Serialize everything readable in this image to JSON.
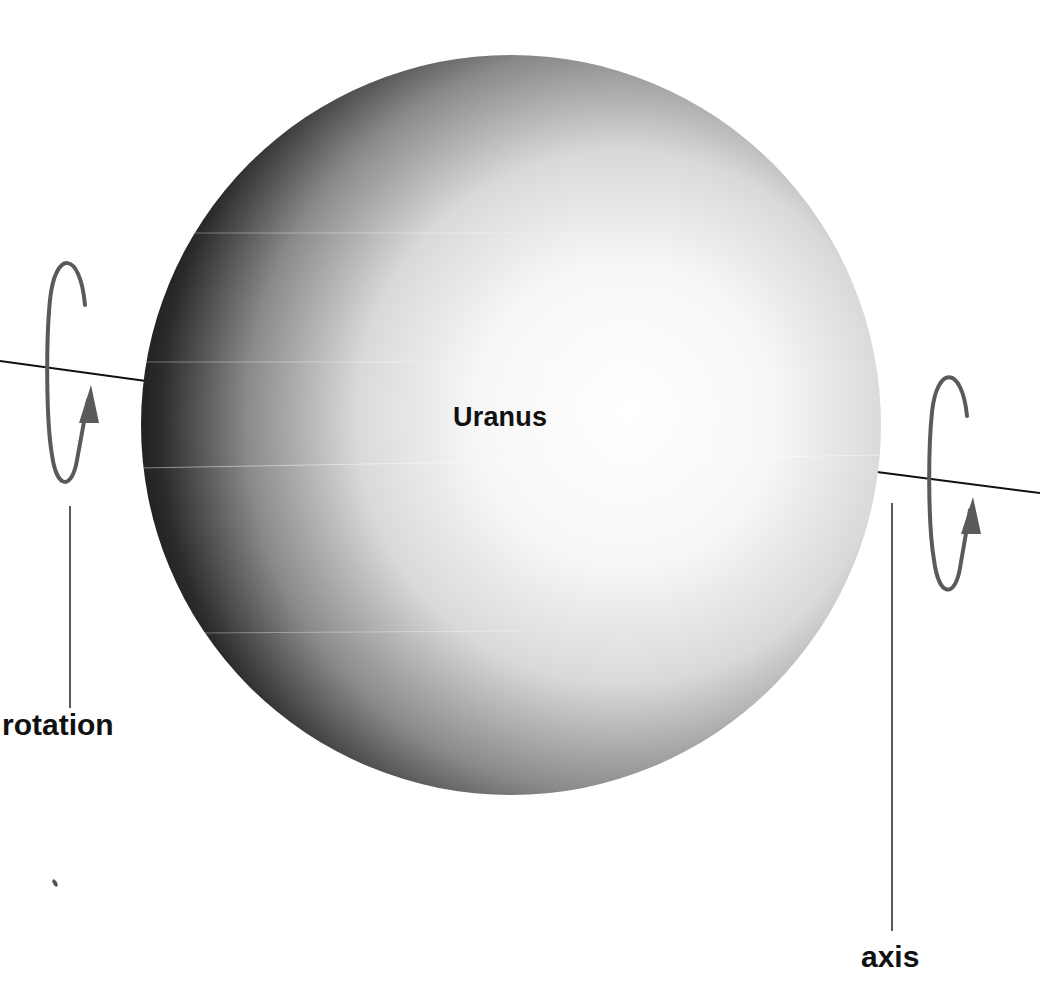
{
  "diagram": {
    "planet": {
      "name": "Uranus",
      "center": [
        511,
        425
      ],
      "radius": 370,
      "colors": {
        "highlight": "#ffffff",
        "mid": "#bdbdbd",
        "shadow": "#0c0c0c"
      }
    },
    "labels": {
      "rotation": "rotation",
      "axis": "axis"
    },
    "arrow_color": "#5a5a5a",
    "line_color": "#111111"
  }
}
